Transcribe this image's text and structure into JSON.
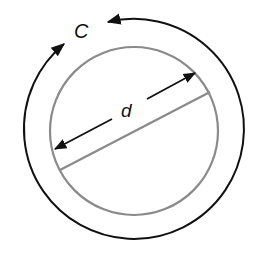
{
  "diagram": {
    "type": "circle-circumference-diameter",
    "labels": {
      "circumference": "C",
      "diameter": "d"
    },
    "colors": {
      "outer_arc": "#111111",
      "inner_circle": "#8a8a8a",
      "diameter_line": "#8a8a8a",
      "arrows": "#111111",
      "background": "#ffffff"
    }
  }
}
